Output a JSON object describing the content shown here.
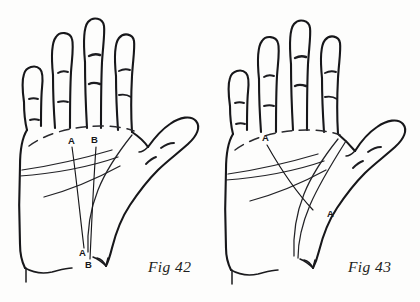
{
  "page": {
    "background_color": "#fdfdfc",
    "ink_color": "#17171a"
  },
  "figures": [
    {
      "id": "fig-42",
      "caption": "Fig 42",
      "hand": "left-hand-palm",
      "description": "Open palm with four fingers and thumb, showing two near-vertical fate lines labelled A and B",
      "labels": [
        {
          "text": "A",
          "role": "line-a-top-label",
          "x": 72,
          "y": 141
        },
        {
          "text": "B",
          "role": "line-b-top-label",
          "x": 95,
          "y": 140
        },
        {
          "text": "A",
          "role": "line-a-bottom-label",
          "x": 83,
          "y": 252
        },
        {
          "text": "B",
          "role": "line-b-bottom-label",
          "x": 89,
          "y": 264
        }
      ],
      "lines": [
        {
          "name": "line-a",
          "label": "A"
        },
        {
          "name": "line-b",
          "label": "B"
        },
        {
          "name": "heart-line",
          "label": ""
        },
        {
          "name": "head-line",
          "label": ""
        },
        {
          "name": "life-line",
          "label": ""
        }
      ]
    },
    {
      "id": "fig-43",
      "caption": "Fig 43",
      "hand": "left-hand-palm",
      "description": "Open palm with four fingers and thumb, showing one long fate line labelled A at both ends",
      "labels": [
        {
          "text": "A",
          "role": "line-a-top-label",
          "x": 262,
          "y": 138
        },
        {
          "text": "A",
          "role": "line-a-bottom-label",
          "x": 327,
          "y": 214
        }
      ],
      "lines": [
        {
          "name": "line-a",
          "label": "A"
        },
        {
          "name": "heart-line",
          "label": ""
        },
        {
          "name": "head-line",
          "label": ""
        },
        {
          "name": "life-line",
          "label": ""
        }
      ]
    }
  ],
  "captions": {
    "fig42": "Fig 42",
    "fig43": "Fig 43"
  },
  "markers": {
    "a": "A",
    "b": "B"
  }
}
